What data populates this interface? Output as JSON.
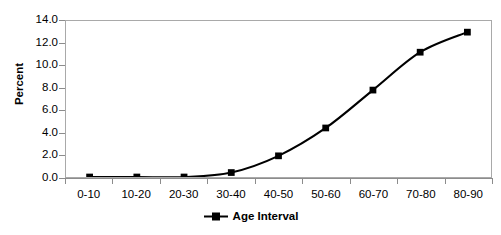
{
  "chart_data": {
    "type": "line",
    "title": "",
    "subtitle": "",
    "xlabel": "",
    "ylabel": "Percent",
    "categories": [
      "0-10",
      "10-20",
      "20-30",
      "30-40",
      "40-50",
      "50-60",
      "60-70",
      "70-80",
      "80-90"
    ],
    "values": [
      0.0,
      0.0,
      0.0,
      0.4,
      1.9,
      4.4,
      7.8,
      11.2,
      13.0
    ],
    "series": [
      {
        "name": "Age Interval",
        "values": [
          0.0,
          0.0,
          0.0,
          0.4,
          1.9,
          4.4,
          7.8,
          11.2,
          13.0
        ]
      }
    ],
    "ylim": [
      0.0,
      14.0
    ],
    "ytick_step": 2.0,
    "ytick_labels": [
      "0.0",
      "2.0",
      "4.0",
      "6.0",
      "8.0",
      "10.0",
      "12.0",
      "14.0"
    ],
    "ytick_values": [
      0.0,
      2.0,
      4.0,
      6.0,
      8.0,
      10.0,
      12.0,
      14.0
    ],
    "grid": false,
    "legend_position": "bottom",
    "marker": "square",
    "line_color": "#000000",
    "marker_color": "#000000",
    "axis_color": "#8c8c8c",
    "plot_border_color": "#a9a9a9",
    "background_color": "#ffffff"
  },
  "legend": {
    "entries": [
      {
        "label": "Age Interval",
        "symbol": "line-square-marker"
      }
    ]
  },
  "axes": {
    "y_title": "Percent"
  }
}
